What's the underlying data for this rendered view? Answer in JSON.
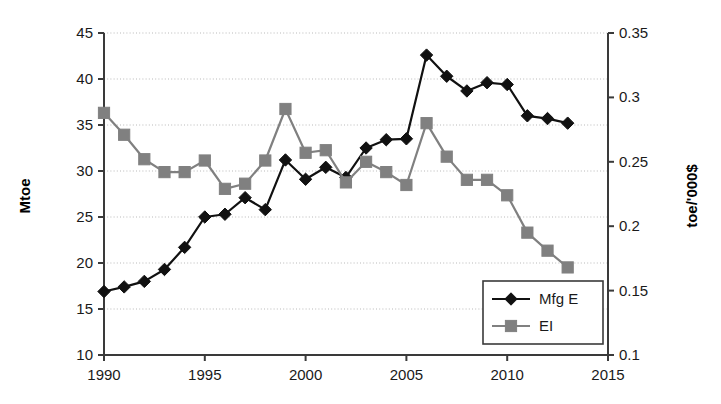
{
  "chart_data": {
    "type": "line",
    "title": "",
    "xlabel": "",
    "ylabel": "Mtoe",
    "y2label": "toe/'000$",
    "x": [
      1990,
      1991,
      1992,
      1993,
      1994,
      1995,
      1996,
      1997,
      1998,
      1999,
      2000,
      2001,
      2002,
      2003,
      2004,
      2005,
      2006,
      2007,
      2008,
      2009,
      2010,
      2011,
      2012,
      2013
    ],
    "xlim": [
      1990,
      2015
    ],
    "ylim": [
      10,
      45
    ],
    "y2lim": [
      0.1,
      0.35
    ],
    "xticks": [
      1990,
      1995,
      2000,
      2005,
      2010,
      2015
    ],
    "yticks": [
      10,
      15,
      20,
      25,
      30,
      35,
      40,
      45
    ],
    "y2ticks": [
      0.1,
      0.15,
      0.2,
      0.25,
      0.3,
      0.35
    ],
    "xtick_labels": [
      "1990",
      "1995",
      "2000",
      "2005",
      "2010",
      "2015"
    ],
    "ytick_labels": [
      "10",
      "15",
      "20",
      "25",
      "30",
      "35",
      "40",
      "45"
    ],
    "y2tick_labels": [
      "0.1",
      "0.15",
      "0.2",
      "0.25",
      "0.3",
      "0.35"
    ],
    "grid": true,
    "grid_axis": "y",
    "legend_position": "lower-right",
    "series": [
      {
        "name": "Mfg E",
        "axis": "left",
        "color": "#111111",
        "marker": "diamond",
        "values": [
          16.9,
          17.4,
          18.0,
          19.3,
          21.7,
          25.0,
          25.3,
          27.1,
          25.8,
          31.2,
          29.1,
          30.4,
          29.3,
          32.5,
          33.4,
          33.5,
          42.6,
          40.3,
          38.7,
          39.6,
          39.4,
          36.0,
          35.7,
          35.2
        ]
      },
      {
        "name": "EI",
        "axis": "right",
        "color": "#808080",
        "marker": "square",
        "values": [
          0.288,
          0.271,
          0.252,
          0.242,
          0.242,
          0.251,
          0.229,
          0.233,
          0.251,
          0.291,
          0.257,
          0.259,
          0.234,
          0.25,
          0.242,
          0.232,
          0.28,
          0.254,
          0.236,
          0.236,
          0.224,
          0.195,
          0.181,
          0.168
        ]
      }
    ],
    "series_values_left_axis_equivalent": {
      "EI": [
        36.3,
        33.9,
        31.3,
        29.9,
        29.9,
        31.1,
        28.0,
        28.6,
        31.1,
        36.7,
        31.9,
        32.2,
        28.8,
        31.0,
        29.8,
        28.5,
        35.2,
        31.5,
        28.9,
        28.9,
        27.3,
        23.0,
        21.2,
        19.6
      ]
    }
  },
  "legend": {
    "items": [
      {
        "label": "Mfg E",
        "marker": "diamond",
        "color": "#111111"
      },
      {
        "label": "EI",
        "marker": "square",
        "color": "#808080"
      }
    ]
  },
  "axes": {
    "left_title": "Mtoe",
    "right_title": "toe/'000$"
  }
}
